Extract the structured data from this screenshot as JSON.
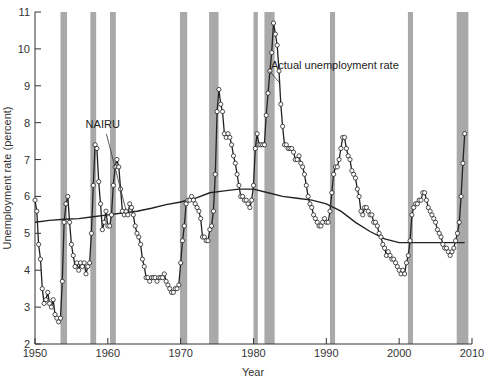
{
  "chart_data": {
    "type": "line",
    "title": "",
    "xlabel": "Year",
    "ylabel": "Unemployment rate (percent)",
    "xlim": [
      1950,
      2010
    ],
    "ylim": [
      2,
      11
    ],
    "x_ticks": [
      1950,
      1960,
      1970,
      1980,
      1990,
      2000,
      2010
    ],
    "y_ticks": [
      2,
      3,
      4,
      5,
      6,
      7,
      8,
      9,
      10,
      11
    ],
    "grid": false,
    "legend": "inline annotations",
    "annotations": [
      {
        "text": "NAIRU",
        "x": 1959.3,
        "y": 7.85
      },
      {
        "text": "Actual unemployment rate",
        "x": 1982.4,
        "y": 9.45
      }
    ],
    "recession_shading_color": "#a9a9a9",
    "recessions": [
      [
        1953.5,
        1954.4
      ],
      [
        1957.6,
        1958.4
      ],
      [
        1960.3,
        1961.1
      ],
      [
        1969.9,
        1970.9
      ],
      [
        1973.9,
        1975.2
      ],
      [
        1980.0,
        1980.6
      ],
      [
        1981.5,
        1982.9
      ],
      [
        1990.5,
        1991.2
      ],
      [
        2001.2,
        2001.9
      ],
      [
        2007.9,
        2009.5
      ]
    ],
    "series": [
      {
        "name": "Actual unemployment rate",
        "marker": "open circle",
        "points": [
          [
            1950.0,
            5.9
          ],
          [
            1950.25,
            5.6
          ],
          [
            1950.5,
            4.7
          ],
          [
            1950.75,
            4.3
          ],
          [
            1951.0,
            3.5
          ],
          [
            1951.25,
            3.1
          ],
          [
            1951.5,
            3.2
          ],
          [
            1951.75,
            3.4
          ],
          [
            1952.0,
            3.1
          ],
          [
            1952.25,
            3.0
          ],
          [
            1952.5,
            3.2
          ],
          [
            1952.75,
            2.8
          ],
          [
            1953.0,
            2.7
          ],
          [
            1953.25,
            2.6
          ],
          [
            1953.5,
            2.7
          ],
          [
            1953.75,
            3.7
          ],
          [
            1954.0,
            5.3
          ],
          [
            1954.25,
            5.8
          ],
          [
            1954.5,
            6.0
          ],
          [
            1954.75,
            5.3
          ],
          [
            1955.0,
            4.7
          ],
          [
            1955.25,
            4.4
          ],
          [
            1955.5,
            4.1
          ],
          [
            1955.75,
            4.2
          ],
          [
            1956.0,
            4.0
          ],
          [
            1956.25,
            4.2
          ],
          [
            1956.5,
            4.1
          ],
          [
            1956.75,
            4.2
          ],
          [
            1957.0,
            3.9
          ],
          [
            1957.25,
            4.1
          ],
          [
            1957.5,
            4.2
          ],
          [
            1957.75,
            5.0
          ],
          [
            1958.0,
            6.3
          ],
          [
            1958.25,
            7.4
          ],
          [
            1958.5,
            7.3
          ],
          [
            1958.75,
            6.4
          ],
          [
            1959.0,
            5.8
          ],
          [
            1959.25,
            5.1
          ],
          [
            1959.5,
            5.3
          ],
          [
            1959.75,
            5.6
          ],
          [
            1960.0,
            5.2
          ],
          [
            1960.25,
            5.2
          ],
          [
            1960.5,
            5.5
          ],
          [
            1960.75,
            6.3
          ],
          [
            1961.0,
            6.8
          ],
          [
            1961.25,
            7.0
          ],
          [
            1961.5,
            6.8
          ],
          [
            1961.75,
            6.2
          ],
          [
            1962.0,
            5.6
          ],
          [
            1962.25,
            5.5
          ],
          [
            1962.5,
            5.6
          ],
          [
            1962.75,
            5.5
          ],
          [
            1963.0,
            5.8
          ],
          [
            1963.25,
            5.7
          ],
          [
            1963.5,
            5.5
          ],
          [
            1963.75,
            5.2
          ],
          [
            1964.0,
            5.0
          ],
          [
            1964.25,
            4.9
          ],
          [
            1964.5,
            4.7
          ],
          [
            1964.75,
            4.3
          ],
          [
            1965.0,
            4.1
          ],
          [
            1965.25,
            3.8
          ],
          [
            1965.5,
            3.8
          ],
          [
            1965.75,
            3.7
          ],
          [
            1966.0,
            3.8
          ],
          [
            1966.25,
            3.8
          ],
          [
            1966.5,
            3.8
          ],
          [
            1966.75,
            3.7
          ],
          [
            1967.0,
            3.8
          ],
          [
            1967.25,
            3.8
          ],
          [
            1967.5,
            3.8
          ],
          [
            1967.75,
            3.9
          ],
          [
            1968.0,
            3.7
          ],
          [
            1968.25,
            3.6
          ],
          [
            1968.5,
            3.5
          ],
          [
            1968.75,
            3.4
          ],
          [
            1969.0,
            3.4
          ],
          [
            1969.25,
            3.5
          ],
          [
            1969.5,
            3.5
          ],
          [
            1969.75,
            3.6
          ],
          [
            1970.0,
            4.2
          ],
          [
            1970.25,
            4.8
          ],
          [
            1970.5,
            5.2
          ],
          [
            1970.75,
            5.8
          ],
          [
            1971.0,
            5.9
          ],
          [
            1971.25,
            5.9
          ],
          [
            1971.5,
            6.0
          ],
          [
            1971.75,
            5.9
          ],
          [
            1972.0,
            5.8
          ],
          [
            1972.25,
            5.7
          ],
          [
            1972.5,
            5.6
          ],
          [
            1972.75,
            5.4
          ],
          [
            1973.0,
            4.9
          ],
          [
            1973.25,
            4.9
          ],
          [
            1973.5,
            4.8
          ],
          [
            1973.75,
            4.8
          ],
          [
            1974.0,
            5.1
          ],
          [
            1974.25,
            5.2
          ],
          [
            1974.5,
            5.6
          ],
          [
            1974.75,
            6.6
          ],
          [
            1975.0,
            8.3
          ],
          [
            1975.25,
            8.9
          ],
          [
            1975.5,
            8.5
          ],
          [
            1975.75,
            8.3
          ],
          [
            1976.0,
            7.7
          ],
          [
            1976.25,
            7.6
          ],
          [
            1976.5,
            7.7
          ],
          [
            1976.75,
            7.6
          ],
          [
            1977.0,
            7.4
          ],
          [
            1977.25,
            7.1
          ],
          [
            1977.5,
            6.9
          ],
          [
            1977.75,
            6.6
          ],
          [
            1978.0,
            6.3
          ],
          [
            1978.25,
            6.0
          ],
          [
            1978.5,
            6.0
          ],
          [
            1978.75,
            5.9
          ],
          [
            1979.0,
            5.9
          ],
          [
            1979.25,
            5.8
          ],
          [
            1979.5,
            5.7
          ],
          [
            1979.75,
            5.9
          ],
          [
            1980.0,
            6.3
          ],
          [
            1980.25,
            7.3
          ],
          [
            1980.5,
            7.7
          ],
          [
            1980.75,
            7.4
          ],
          [
            1981.0,
            7.4
          ],
          [
            1981.25,
            7.4
          ],
          [
            1981.5,
            7.4
          ],
          [
            1981.75,
            8.2
          ],
          [
            1982.0,
            8.8
          ],
          [
            1982.25,
            9.4
          ],
          [
            1982.5,
            9.9
          ],
          [
            1982.75,
            10.7
          ],
          [
            1983.0,
            10.4
          ],
          [
            1983.25,
            10.1
          ],
          [
            1983.5,
            9.4
          ],
          [
            1983.75,
            8.5
          ],
          [
            1984.0,
            7.9
          ],
          [
            1984.25,
            7.4
          ],
          [
            1984.5,
            7.4
          ],
          [
            1984.75,
            7.3
          ],
          [
            1985.0,
            7.3
          ],
          [
            1985.25,
            7.3
          ],
          [
            1985.5,
            7.2
          ],
          [
            1985.75,
            7.0
          ],
          [
            1986.0,
            7.0
          ],
          [
            1986.25,
            7.1
          ],
          [
            1986.5,
            6.9
          ],
          [
            1986.75,
            6.8
          ],
          [
            1987.0,
            6.6
          ],
          [
            1987.25,
            6.3
          ],
          [
            1987.5,
            6.0
          ],
          [
            1987.75,
            5.8
          ],
          [
            1988.0,
            5.7
          ],
          [
            1988.25,
            5.5
          ],
          [
            1988.5,
            5.4
          ],
          [
            1988.75,
            5.3
          ],
          [
            1989.0,
            5.2
          ],
          [
            1989.25,
            5.2
          ],
          [
            1989.5,
            5.3
          ],
          [
            1989.75,
            5.4
          ],
          [
            1990.0,
            5.3
          ],
          [
            1990.25,
            5.3
          ],
          [
            1990.5,
            5.6
          ],
          [
            1990.75,
            6.1
          ],
          [
            1991.0,
            6.6
          ],
          [
            1991.25,
            6.8
          ],
          [
            1991.5,
            6.8
          ],
          [
            1991.75,
            7.0
          ],
          [
            1992.0,
            7.3
          ],
          [
            1992.25,
            7.6
          ],
          [
            1992.5,
            7.6
          ],
          [
            1992.75,
            7.3
          ],
          [
            1993.0,
            7.1
          ],
          [
            1993.25,
            7.0
          ],
          [
            1993.5,
            6.7
          ],
          [
            1993.75,
            6.6
          ],
          [
            1994.0,
            6.5
          ],
          [
            1994.25,
            6.2
          ],
          [
            1994.5,
            6.0
          ],
          [
            1994.75,
            5.6
          ],
          [
            1995.0,
            5.5
          ],
          [
            1995.25,
            5.7
          ],
          [
            1995.5,
            5.7
          ],
          [
            1995.75,
            5.6
          ],
          [
            1996.0,
            5.5
          ],
          [
            1996.25,
            5.5
          ],
          [
            1996.5,
            5.3
          ],
          [
            1996.75,
            5.3
          ],
          [
            1997.0,
            5.2
          ],
          [
            1997.25,
            5.0
          ],
          [
            1997.5,
            4.9
          ],
          [
            1997.75,
            4.7
          ],
          [
            1998.0,
            4.6
          ],
          [
            1998.25,
            4.4
          ],
          [
            1998.5,
            4.5
          ],
          [
            1998.75,
            4.4
          ],
          [
            1999.0,
            4.3
          ],
          [
            1999.25,
            4.3
          ],
          [
            1999.5,
            4.2
          ],
          [
            1999.75,
            4.1
          ],
          [
            2000.0,
            4.0
          ],
          [
            2000.25,
            3.9
          ],
          [
            2000.5,
            4.0
          ],
          [
            2000.75,
            3.9
          ],
          [
            2001.0,
            4.2
          ],
          [
            2001.25,
            4.4
          ],
          [
            2001.5,
            4.8
          ],
          [
            2001.75,
            5.5
          ],
          [
            2002.0,
            5.7
          ],
          [
            2002.25,
            5.8
          ],
          [
            2002.5,
            5.8
          ],
          [
            2002.75,
            5.9
          ],
          [
            2003.0,
            5.9
          ],
          [
            2003.25,
            6.1
          ],
          [
            2003.5,
            6.1
          ],
          [
            2003.75,
            5.9
          ],
          [
            2004.0,
            5.7
          ],
          [
            2004.25,
            5.6
          ],
          [
            2004.5,
            5.5
          ],
          [
            2004.75,
            5.4
          ],
          [
            2005.0,
            5.3
          ],
          [
            2005.25,
            5.1
          ],
          [
            2005.5,
            5.0
          ],
          [
            2005.75,
            4.9
          ],
          [
            2006.0,
            4.7
          ],
          [
            2006.25,
            4.6
          ],
          [
            2006.5,
            4.6
          ],
          [
            2006.75,
            4.5
          ],
          [
            2007.0,
            4.4
          ],
          [
            2007.25,
            4.5
          ],
          [
            2007.5,
            4.6
          ],
          [
            2007.75,
            4.8
          ],
          [
            2008.0,
            5.0
          ],
          [
            2008.25,
            5.3
          ],
          [
            2008.5,
            6.0
          ],
          [
            2008.75,
            6.9
          ],
          [
            2009.0,
            7.7
          ]
        ]
      },
      {
        "name": "NAIRU",
        "marker": "none",
        "points": [
          [
            1950,
            5.3
          ],
          [
            1952,
            5.35
          ],
          [
            1954,
            5.38
          ],
          [
            1956,
            5.4
          ],
          [
            1958,
            5.45
          ],
          [
            1960,
            5.5
          ],
          [
            1962,
            5.55
          ],
          [
            1964,
            5.6
          ],
          [
            1966,
            5.68
          ],
          [
            1968,
            5.78
          ],
          [
            1970,
            5.85
          ],
          [
            1972,
            5.95
          ],
          [
            1974,
            6.1
          ],
          [
            1976,
            6.15
          ],
          [
            1978,
            6.2
          ],
          [
            1980,
            6.2
          ],
          [
            1982,
            6.1
          ],
          [
            1984,
            6.0
          ],
          [
            1986,
            5.95
          ],
          [
            1988,
            5.9
          ],
          [
            1990,
            5.8
          ],
          [
            1992,
            5.6
          ],
          [
            1994,
            5.3
          ],
          [
            1996,
            5.05
          ],
          [
            1998,
            4.85
          ],
          [
            2000,
            4.75
          ],
          [
            2001,
            4.75
          ],
          [
            2002,
            4.75
          ],
          [
            2004,
            4.75
          ],
          [
            2006,
            4.75
          ],
          [
            2008,
            4.75
          ],
          [
            2009,
            4.75
          ]
        ]
      }
    ]
  }
}
